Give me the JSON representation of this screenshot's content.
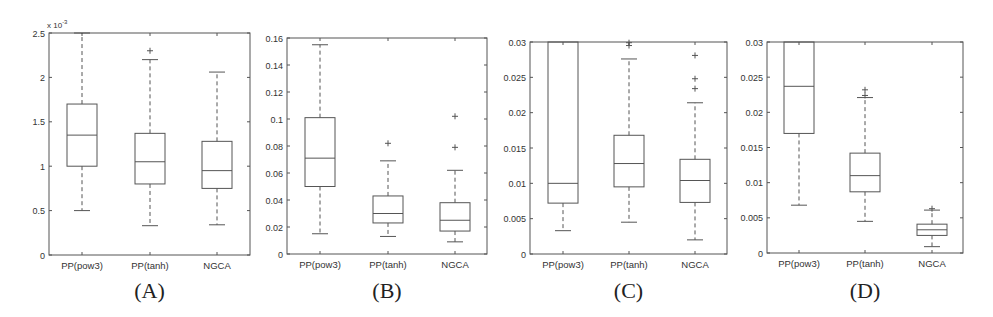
{
  "chart_data": [
    {
      "type": "box",
      "panel_label": "(A)",
      "title": "",
      "xlabel": "",
      "ylabel": "",
      "y_exponent_label": "x 10",
      "y_exponent_power": "-3",
      "ylim": [
        0,
        2.5
      ],
      "yticks": [
        0,
        0.5,
        1,
        1.5,
        2,
        2.5
      ],
      "ytick_labels": [
        "0",
        "0.5",
        "1",
        "1.5",
        "2",
        "2.5"
      ],
      "categories": [
        "PP(pow3)",
        "PP(tanh)",
        "NGCA"
      ],
      "series": [
        {
          "name": "PP(pow3)",
          "whisker_low": 0.5,
          "q1": 1.0,
          "median": 1.35,
          "q3": 1.7,
          "whisker_high": 2.5,
          "outliers": []
        },
        {
          "name": "PP(tanh)",
          "whisker_low": 0.33,
          "q1": 0.8,
          "median": 1.05,
          "q3": 1.37,
          "whisker_high": 2.2,
          "outliers": [
            2.3
          ]
        },
        {
          "name": "NGCA",
          "whisker_low": 0.34,
          "q1": 0.75,
          "median": 0.95,
          "q3": 1.28,
          "whisker_high": 2.06,
          "outliers": []
        }
      ],
      "grid": false
    },
    {
      "type": "box",
      "panel_label": "(B)",
      "title": "",
      "xlabel": "",
      "ylabel": "",
      "ylim": [
        0,
        0.16
      ],
      "yticks": [
        0,
        0.02,
        0.04,
        0.06,
        0.08,
        0.1,
        0.12,
        0.14,
        0.16
      ],
      "ytick_labels": [
        "0",
        "0.02",
        "0.04",
        "0.06",
        "0.08",
        "0.1",
        "0.12",
        "0.14",
        "0.16"
      ],
      "categories": [
        "PP(pow3)",
        "PP(tanh)",
        "NGCA"
      ],
      "series": [
        {
          "name": "PP(pow3)",
          "whisker_low": 0.015,
          "q1": 0.05,
          "median": 0.071,
          "q3": 0.101,
          "whisker_high": 0.155,
          "outliers": []
        },
        {
          "name": "PP(tanh)",
          "whisker_low": 0.013,
          "q1": 0.023,
          "median": 0.03,
          "q3": 0.043,
          "whisker_high": 0.069,
          "outliers": [
            0.082
          ]
        },
        {
          "name": "NGCA",
          "whisker_low": 0.009,
          "q1": 0.017,
          "median": 0.025,
          "q3": 0.038,
          "whisker_high": 0.062,
          "outliers": [
            0.079,
            0.102
          ]
        }
      ],
      "grid": false
    },
    {
      "type": "box",
      "panel_label": "(C)",
      "title": "",
      "xlabel": "",
      "ylabel": "",
      "ylim": [
        0,
        0.03
      ],
      "yticks": [
        0,
        0.005,
        0.01,
        0.015,
        0.02,
        0.025,
        0.03
      ],
      "ytick_labels": [
        "0",
        "0.005",
        "0.01",
        "0.015",
        "0.02",
        "0.025",
        "0.03"
      ],
      "categories": [
        "PP(pow3)",
        "PP(tanh)",
        "NGCA"
      ],
      "series": [
        {
          "name": "PP(pow3)",
          "whisker_low": 0.0033,
          "q1": 0.0072,
          "median": 0.01,
          "q3": 0.035,
          "whisker_high": 0.05,
          "outliers": [],
          "note": "box clipped above 0.03"
        },
        {
          "name": "PP(tanh)",
          "whisker_low": 0.0045,
          "q1": 0.0095,
          "median": 0.0128,
          "q3": 0.0168,
          "whisker_high": 0.0276,
          "outliers": [
            0.0295,
            0.0299
          ]
        },
        {
          "name": "NGCA",
          "whisker_low": 0.002,
          "q1": 0.0073,
          "median": 0.0104,
          "q3": 0.0134,
          "whisker_high": 0.0214,
          "outliers": [
            0.0234,
            0.0248,
            0.0281
          ]
        }
      ],
      "grid": false
    },
    {
      "type": "box",
      "panel_label": "(D)",
      "title": "",
      "xlabel": "",
      "ylabel": "",
      "ylim": [
        0,
        0.03
      ],
      "yticks": [
        0,
        0.005,
        0.01,
        0.015,
        0.02,
        0.025,
        0.03
      ],
      "ytick_labels": [
        "0",
        "0.005",
        "0.01",
        "0.015",
        "0.02",
        "0.025",
        "0.03"
      ],
      "categories": [
        "PP(pow3)",
        "PP(tanh)",
        "NGCA"
      ],
      "series": [
        {
          "name": "PP(pow3)",
          "whisker_low": 0.0068,
          "q1": 0.017,
          "median": 0.0237,
          "q3": 0.035,
          "whisker_high": 0.05,
          "outliers": [],
          "note": "box clipped above 0.03"
        },
        {
          "name": "PP(tanh)",
          "whisker_low": 0.0045,
          "q1": 0.0087,
          "median": 0.011,
          "q3": 0.0142,
          "whisker_high": 0.0221,
          "outliers": [
            0.0224,
            0.0232
          ]
        },
        {
          "name": "NGCA",
          "whisker_low": 0.0009,
          "q1": 0.0025,
          "median": 0.0033,
          "q3": 0.0041,
          "whisker_high": 0.0061,
          "outliers": [
            0.0063
          ]
        }
      ],
      "grid": false
    }
  ],
  "layout": {
    "panels": [
      {
        "x0": 49,
        "x1": 250,
        "ytop": 33,
        "ybot": 255,
        "centers": [
          82,
          150,
          217
        ],
        "box_w": 30
      },
      {
        "x0": 287,
        "x1": 487,
        "ytop": 38,
        "ybot": 254,
        "centers": [
          320,
          388,
          455
        ],
        "box_w": 30
      },
      {
        "x0": 530,
        "x1": 727,
        "ytop": 42,
        "ybot": 254,
        "centers": [
          563,
          629,
          695
        ],
        "box_w": 30
      },
      {
        "x0": 767,
        "x1": 963,
        "ytop": 42,
        "ybot": 253,
        "centers": [
          799,
          865,
          932
        ],
        "box_w": 30
      }
    ],
    "colors": {
      "frame": "#555555",
      "box": "#555555",
      "text": "#333333"
    }
  }
}
